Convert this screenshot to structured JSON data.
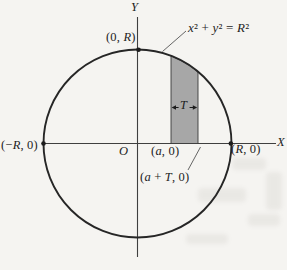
{
  "figure": {
    "type": "circle-with-vertical-strip-diagram",
    "equation": "x² + y² = R²",
    "axis_labels": {
      "x": "X",
      "y": "Y"
    },
    "points": {
      "top": "(0, R)",
      "left": "(−R, 0)",
      "right": "(R, 0)",
      "origin": "O",
      "strip_left": "(a, 0)",
      "strip_right": "(a + T, 0)"
    },
    "strip": {
      "width_label": "T"
    },
    "colors": {
      "background": "#f5f4f1",
      "curve": "#262626",
      "axis": "#3f3f3f",
      "strip_fill": "#a7a7a7",
      "text": "#1d1d1d"
    }
  }
}
